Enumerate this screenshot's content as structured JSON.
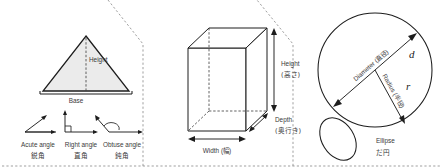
{
  "page": {
    "width": 444,
    "height": 168,
    "background": "#ffffff",
    "ink": "#1d1d1d",
    "fill_gray": "#ebebeb",
    "divider_color": "#8e8e8e"
  },
  "panels": [
    {
      "id": "triangle-panel",
      "figure": "triangle",
      "labels": {
        "height": "Height",
        "base": "Base"
      },
      "angles": [
        {
          "id": "acute",
          "en": "Acute angle",
          "jp": "鋭角"
        },
        {
          "id": "right",
          "en": "Right angle",
          "jp": "直角"
        },
        {
          "id": "obtuse",
          "en": "Obtuse angle",
          "jp": "鈍角"
        }
      ]
    },
    {
      "id": "cuboid-panel",
      "figure": "cuboid",
      "labels": {
        "height_en": "Height",
        "height_jp": "(高さ)",
        "depth_en": "Depth",
        "depth_jp": "(奥行き)",
        "width": "Width (幅)"
      }
    },
    {
      "id": "circle-panel",
      "figure": "circle",
      "labels": {
        "diameter": "Diameter (直径)",
        "diameter_symbol": "d",
        "radius": "Radius (半径)",
        "radius_symbol": "r",
        "ellipse_en": "Ellipse",
        "ellipse_jp": "だ円"
      }
    }
  ]
}
